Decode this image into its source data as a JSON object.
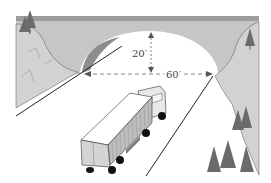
{
  "diagram": {
    "height_label": "20′",
    "width_label": "60′",
    "colors": {
      "bridge": "#c8c8c8",
      "bridge_top": "#9a9a9a",
      "cliff": "#d0d0d0",
      "shadow": "#8a8a8a",
      "tree": "#6e6e6e",
      "road_line": "#222222",
      "dimension": "#666666"
    }
  }
}
